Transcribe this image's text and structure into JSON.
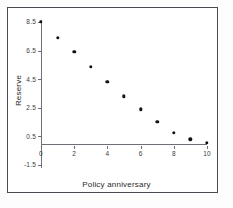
{
  "chart_data": {
    "type": "scatter",
    "title": "",
    "xlabel": "Policy anniversary",
    "ylabel": "Reserve",
    "xlim": [
      0,
      10
    ],
    "ylim": [
      -1.5,
      8.5
    ],
    "xticks": [
      "0",
      "2",
      "4",
      "6",
      "8",
      "10"
    ],
    "xtick_values": [
      0,
      2,
      4,
      6,
      8,
      10
    ],
    "yticks": [
      "8.5",
      "6.5",
      "4.5",
      "2.5",
      "0.5",
      "-1.5"
    ],
    "ytick_values": [
      8.5,
      6.5,
      4.5,
      2.5,
      0.5,
      -1.5
    ],
    "grid": false,
    "legend": null,
    "marker": "filled-circle",
    "marker_color": "#111111",
    "axis_color": "#6f6f77",
    "x": [
      0,
      1,
      2,
      3,
      4,
      5,
      6,
      7,
      8,
      9,
      10
    ],
    "values": [
      8.5,
      7.4,
      6.4,
      5.35,
      4.3,
      3.3,
      2.4,
      1.5,
      0.75,
      0.3,
      0.05
    ],
    "points": [
      {
        "x": 0,
        "y": 8.5
      },
      {
        "x": 1,
        "y": 7.4
      },
      {
        "x": 2,
        "y": 6.4
      },
      {
        "x": 3,
        "y": 5.35
      },
      {
        "x": 4,
        "y": 4.3
      },
      {
        "x": 5,
        "y": 3.3
      },
      {
        "x": 6,
        "y": 2.4
      },
      {
        "x": 7,
        "y": 1.5
      },
      {
        "x": 8,
        "y": 0.75
      },
      {
        "x": 9,
        "y": 0.3
      },
      {
        "x": 10,
        "y": 0.05
      }
    ]
  },
  "figure": {
    "border_color": "#4a4a52",
    "background": "#ffffff"
  }
}
